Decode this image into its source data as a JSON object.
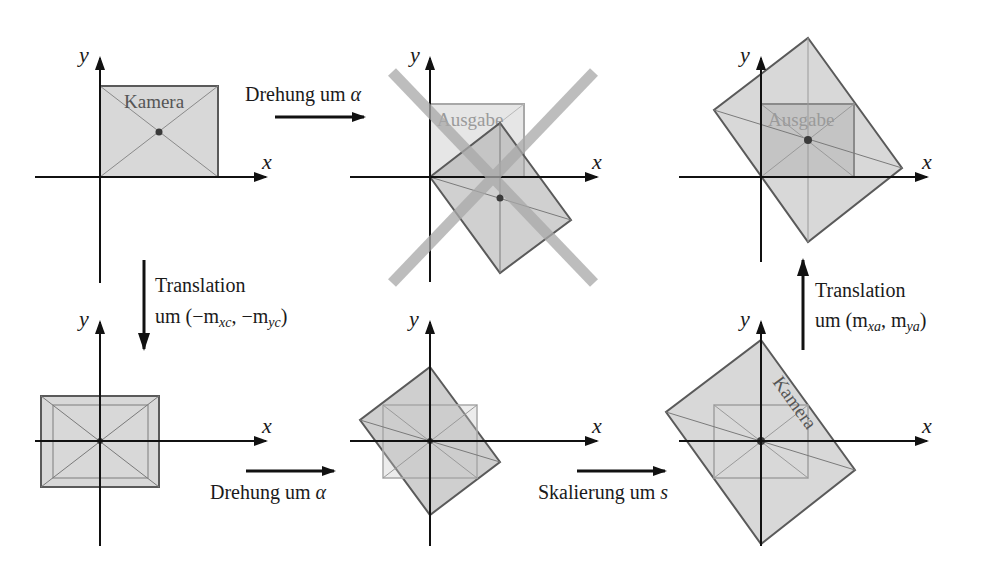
{
  "axes": {
    "x_label": "x",
    "y_label": "y"
  },
  "labels": {
    "camera": "Kamera",
    "output": "Ausgabe"
  },
  "steps": {
    "top_rotation": {
      "text": "Drehung um ",
      "symbol": "α"
    },
    "translate_c": {
      "line1": "Translation",
      "line2_prefix": "um (−m",
      "sub1": "xc",
      "mid": ", −m",
      "sub2": "yc",
      "suffix": ")"
    },
    "rotation": {
      "text": "Drehung um ",
      "symbol": "α"
    },
    "scaling": {
      "text": "Skalierung um ",
      "symbol": "s"
    },
    "translate_a": {
      "line1": "Translation",
      "line2_prefix": "um (m",
      "sub1": "xa",
      "mid": ", m",
      "sub2": "ya",
      "suffix": ")"
    }
  },
  "colors": {
    "axis": "#111111",
    "rect_fill": "#d6d6d6",
    "rect_stroke": "#5a5a5a",
    "output_stroke": "#a8a8a8",
    "cross": "#b4b4b4",
    "dot": "#3a3a3a"
  }
}
